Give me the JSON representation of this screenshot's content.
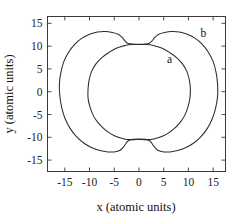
{
  "figure": {
    "background_color": "#ffffff",
    "line_color": "#2b2b2b",
    "axis_color": "#3a3a3a"
  },
  "chart_data": {
    "type": "line",
    "title": "",
    "subtitle": "",
    "xlabel": "x (atomic units)",
    "ylabel": "y (atomic units)",
    "xlim": [
      -18.5,
      17.5
    ],
    "ylim": [
      -17.5,
      16.5
    ],
    "xticks": [
      -15,
      -10,
      -5,
      0,
      5,
      10,
      15
    ],
    "xticklabels": [
      "-15",
      "-10",
      "-5",
      "0",
      "5",
      "10",
      "15"
    ],
    "yticks": [
      -15,
      -10,
      -5,
      0,
      5,
      10,
      15
    ],
    "yticklabels": [
      "-15",
      "-10",
      "-5",
      "0",
      "5",
      "10",
      "15"
    ],
    "grid": false,
    "legend": "inline-annotations",
    "annotations": [
      {
        "text": "a",
        "x": 6.2,
        "y": 6.4,
        "curve": "a"
      },
      {
        "text": "b",
        "x": 13.0,
        "y": 11.9,
        "curve": "b"
      }
    ],
    "series": [
      {
        "name": "a",
        "label": "a",
        "description": "inner closed contour, nearly circular with slight flattening and small neck at top and bottom center",
        "closed": true,
        "x_extent": [
          -10.3,
          10.4
        ],
        "y_extent": [
          -10.5,
          10.4
        ],
        "points": [
          [
            0.0,
            10.35
          ],
          [
            1.2,
            10.35
          ],
          [
            2.2,
            10.3
          ],
          [
            3.4,
            10.0
          ],
          [
            4.8,
            9.5
          ],
          [
            6.2,
            8.6
          ],
          [
            7.6,
            7.5
          ],
          [
            8.8,
            6.1
          ],
          [
            9.7,
            4.4
          ],
          [
            10.2,
            2.5
          ],
          [
            10.4,
            0.6
          ],
          [
            10.3,
            -1.4
          ],
          [
            9.9,
            -3.4
          ],
          [
            9.2,
            -5.3
          ],
          [
            8.2,
            -6.9
          ],
          [
            7.0,
            -8.2
          ],
          [
            5.6,
            -9.3
          ],
          [
            4.2,
            -10.0
          ],
          [
            3.0,
            -10.35
          ],
          [
            1.8,
            -10.5
          ],
          [
            0.6,
            -10.5
          ],
          [
            -0.6,
            -10.5
          ],
          [
            -1.8,
            -10.5
          ],
          [
            -3.0,
            -10.35
          ],
          [
            -4.2,
            -10.0
          ],
          [
            -5.6,
            -9.3
          ],
          [
            -7.0,
            -8.2
          ],
          [
            -8.2,
            -6.9
          ],
          [
            -9.2,
            -5.3
          ],
          [
            -9.9,
            -3.4
          ],
          [
            -10.3,
            -1.4
          ],
          [
            -10.3,
            0.6
          ],
          [
            -10.1,
            2.5
          ],
          [
            -9.6,
            4.4
          ],
          [
            -8.7,
            6.1
          ],
          [
            -7.5,
            7.5
          ],
          [
            -6.1,
            8.6
          ],
          [
            -4.7,
            9.5
          ],
          [
            -3.3,
            10.0
          ],
          [
            -2.1,
            10.3
          ],
          [
            -1.1,
            10.35
          ],
          [
            0.0,
            10.35
          ]
        ]
      },
      {
        "name": "b",
        "label": "b",
        "description": "outer closed contour, two broad lobes joined by narrow neck at top and bottom center where it touches curve a",
        "closed": true,
        "x_extent": [
          -16.1,
          15.9
        ],
        "y_extent": [
          -13.3,
          13.2
        ],
        "points": [
          [
            0.0,
            10.4
          ],
          [
            1.2,
            10.45
          ],
          [
            2.0,
            10.6
          ],
          [
            2.6,
            11.1
          ],
          [
            3.2,
            11.9
          ],
          [
            4.0,
            12.6
          ],
          [
            5.2,
            13.0
          ],
          [
            6.6,
            13.2
          ],
          [
            8.2,
            13.1
          ],
          [
            9.8,
            12.6
          ],
          [
            11.4,
            11.7
          ],
          [
            12.8,
            10.4
          ],
          [
            14.0,
            8.7
          ],
          [
            15.0,
            6.6
          ],
          [
            15.6,
            4.2
          ],
          [
            15.9,
            1.6
          ],
          [
            15.9,
            -1.0
          ],
          [
            15.5,
            -3.6
          ],
          [
            14.8,
            -6.0
          ],
          [
            13.8,
            -8.1
          ],
          [
            12.5,
            -9.9
          ],
          [
            11.0,
            -11.3
          ],
          [
            9.4,
            -12.3
          ],
          [
            7.8,
            -12.9
          ],
          [
            6.3,
            -13.2
          ],
          [
            5.0,
            -13.2
          ],
          [
            3.9,
            -12.9
          ],
          [
            3.2,
            -12.2
          ],
          [
            2.6,
            -11.3
          ],
          [
            2.1,
            -10.7
          ],
          [
            1.3,
            -10.45
          ],
          [
            0.0,
            -10.4
          ],
          [
            -1.3,
            -10.45
          ],
          [
            -2.1,
            -10.7
          ],
          [
            -2.6,
            -11.3
          ],
          [
            -3.2,
            -12.2
          ],
          [
            -3.9,
            -12.9
          ],
          [
            -5.0,
            -13.2
          ],
          [
            -6.3,
            -13.2
          ],
          [
            -7.9,
            -12.9
          ],
          [
            -9.5,
            -12.3
          ],
          [
            -11.1,
            -11.3
          ],
          [
            -12.6,
            -9.9
          ],
          [
            -13.9,
            -8.1
          ],
          [
            -14.9,
            -6.0
          ],
          [
            -15.6,
            -3.6
          ],
          [
            -16.0,
            -1.0
          ],
          [
            -16.1,
            1.6
          ],
          [
            -15.8,
            4.2
          ],
          [
            -15.2,
            6.6
          ],
          [
            -14.2,
            8.7
          ],
          [
            -13.0,
            10.4
          ],
          [
            -11.6,
            11.7
          ],
          [
            -10.0,
            12.6
          ],
          [
            -8.4,
            13.1
          ],
          [
            -6.8,
            13.2
          ],
          [
            -5.4,
            13.0
          ],
          [
            -4.2,
            12.6
          ],
          [
            -3.4,
            11.9
          ],
          [
            -2.8,
            11.1
          ],
          [
            -2.2,
            10.6
          ],
          [
            -1.3,
            10.45
          ],
          [
            0.0,
            10.4
          ]
        ]
      }
    ]
  }
}
